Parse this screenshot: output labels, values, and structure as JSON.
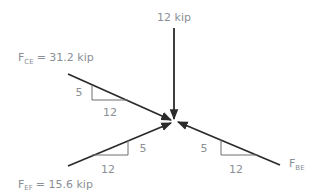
{
  "diagram": {
    "type": "free-body-diagram",
    "joint": "E",
    "colors": {
      "member_line": "#2b2b2b",
      "slope_triangle": "#6f6f6f",
      "label_text": "#8a8f96",
      "background": "#ffffff"
    },
    "forces": [
      {
        "id": "vertical-load",
        "label": "12 kip",
        "direction": "down"
      },
      {
        "id": "F_CE",
        "symbol": "F",
        "subscript": "CE",
        "equals": "= 31.2 kip",
        "direction": "from upper-left toward joint",
        "slope": {
          "rise": "5",
          "run": "12"
        }
      },
      {
        "id": "F_EF",
        "symbol": "F",
        "subscript": "EF",
        "equals": "= 15.6 kip",
        "direction": "from lower-left toward joint",
        "slope": {
          "rise": "5",
          "run": "12"
        }
      },
      {
        "id": "F_BE",
        "symbol": "F",
        "subscript": "BE",
        "direction": "from lower-right toward joint",
        "slope": {
          "rise": "5",
          "run": "12"
        }
      }
    ]
  }
}
